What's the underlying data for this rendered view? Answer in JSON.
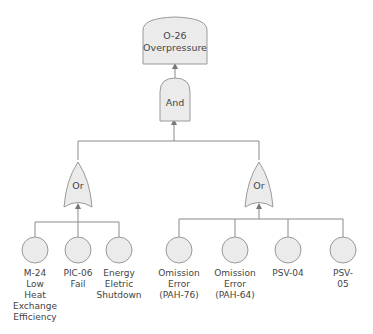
{
  "diagram": {
    "type": "fault-tree",
    "colors": {
      "fill": "#ebebeb",
      "stroke": "#9a9a9a",
      "line": "#8a8a8a",
      "text": "#444444"
    },
    "top_event": {
      "label": "O-26\nOverpressure"
    },
    "and_gate": {
      "label": "And"
    },
    "or_gates": [
      {
        "label": "Or"
      },
      {
        "label": "Or"
      }
    ],
    "left_events": [
      {
        "label": "M-24\nLow\nHeat\nExchange\nEfficiency"
      },
      {
        "label": "PIC-06\nFail"
      },
      {
        "label": "Energy\nEletric\nShutdown"
      }
    ],
    "right_events": [
      {
        "label": "Omission\nError\n(PAH-76)"
      },
      {
        "label": "Omission\nError\n(PAH-64)"
      },
      {
        "label": "PSV-04"
      },
      {
        "label": "PSV-05"
      }
    ]
  }
}
